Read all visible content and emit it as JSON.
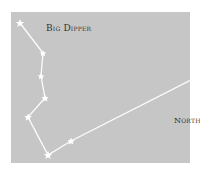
{
  "diagram": {
    "title": "Big Dipper",
    "north_label": "North",
    "colors": {
      "background": "#c6c6c6",
      "star": "#ffffff",
      "line": "#ffffff",
      "text": "#333333"
    },
    "stars": [
      {
        "name": "star-1",
        "x": 20,
        "y": 23
      },
      {
        "name": "star-2",
        "x": 43,
        "y": 53
      },
      {
        "name": "star-3",
        "x": 41,
        "y": 76
      },
      {
        "name": "star-4",
        "x": 45,
        "y": 98
      },
      {
        "name": "star-5",
        "x": 28,
        "y": 117
      },
      {
        "name": "star-6",
        "x": 48,
        "y": 155
      },
      {
        "name": "star-7",
        "x": 71,
        "y": 141
      },
      {
        "name": "polaris",
        "x": 197,
        "y": 77
      }
    ],
    "arrow": {
      "direction": "down",
      "x": 199,
      "y": 97
    }
  }
}
